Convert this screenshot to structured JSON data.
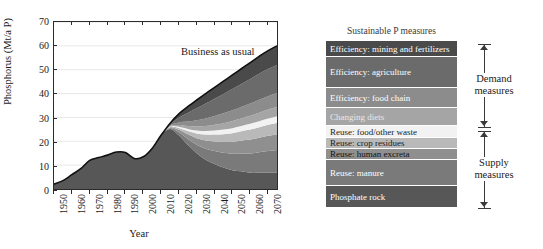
{
  "chart_data": {
    "type": "area",
    "title": "",
    "xlabel": "Year",
    "ylabel": "Phosphorus (Mt/a P)",
    "xlim": [
      1950,
      2075
    ],
    "ylim": [
      0,
      70
    ],
    "ytick_values": [
      0,
      10,
      20,
      30,
      40,
      50,
      60,
      70
    ],
    "xtick_values": [
      1950,
      1960,
      1970,
      1980,
      1990,
      2000,
      2010,
      2020,
      2030,
      2040,
      2050,
      2060,
      2070
    ],
    "grid": "horizontal",
    "legend_position": "right",
    "annotations": [
      {
        "text": "Business as usual",
        "x": 2022,
        "y": 52
      }
    ],
    "x": [
      1950,
      1955,
      1960,
      1965,
      1970,
      1975,
      1980,
      1985,
      1990,
      1995,
      2000,
      2005,
      2010,
      2015,
      2020,
      2025,
      2030,
      2035,
      2040,
      2045,
      2050,
      2055,
      2060,
      2065,
      2070,
      2075
    ],
    "business_as_usual_total": [
      2.0,
      3.5,
      6.0,
      8.5,
      12.0,
      13.2,
      14.2,
      15.5,
      15.3,
      12.8,
      13.5,
      17.0,
      22.5,
      27.5,
      31.5,
      34.5,
      37.3,
      40.0,
      42.6,
      45.2,
      47.8,
      50.4,
      53.0,
      55.6,
      58.0,
      60.0
    ],
    "series": [
      {
        "name": "Efficiency: mining and fertilizers",
        "color": "#4a4a4a",
        "values": [
          0,
          0,
          0,
          0,
          0,
          0,
          0,
          0,
          0,
          0,
          0,
          0,
          0,
          0.4,
          1.6,
          2.6,
          3.5,
          4.2,
          4.8,
          5.4,
          5.9,
          6.4,
          6.9,
          7.3,
          7.7,
          8.0
        ]
      },
      {
        "name": "Efficiency: agriculture",
        "color": "#6b6b6b",
        "values": [
          0,
          0,
          0,
          0,
          0,
          0,
          0,
          0,
          0,
          0,
          0,
          0,
          0,
          0.5,
          2.0,
          3.6,
          5.0,
          6.2,
          7.2,
          8.1,
          8.9,
          9.6,
          10.3,
          10.9,
          11.4,
          11.8
        ]
      },
      {
        "name": "Efficiency: food chain",
        "color": "#8c8c8c",
        "values": [
          0,
          0,
          0,
          0,
          0,
          0,
          0,
          0,
          0,
          0,
          0,
          0,
          0,
          0.3,
          1.1,
          1.9,
          2.6,
          3.2,
          3.7,
          4.1,
          4.5,
          4.8,
          5.1,
          5.4,
          5.6,
          5.8
        ]
      },
      {
        "name": "Changing diets",
        "color": "#a5a5a5",
        "values": [
          0,
          0,
          0,
          0,
          0,
          0,
          0,
          0,
          0,
          0,
          0,
          0,
          0,
          0.2,
          0.7,
          1.2,
          1.7,
          2.1,
          2.4,
          2.7,
          3.0,
          3.2,
          3.4,
          3.6,
          3.8,
          3.9
        ]
      },
      {
        "name": "Reuse: food/other waste",
        "color": "#f2f2f2",
        "values": [
          0,
          0,
          0,
          0,
          0,
          0,
          0,
          0,
          0,
          0,
          0,
          0,
          0,
          0.15,
          0.5,
          0.9,
          1.2,
          1.5,
          1.7,
          1.9,
          2.1,
          2.2,
          2.4,
          2.5,
          2.6,
          2.7
        ]
      },
      {
        "name": "Reuse: crop residues",
        "color": "#b9b9b9",
        "values": [
          0,
          0,
          0,
          0,
          0,
          0,
          0,
          0,
          0,
          0,
          0,
          0,
          0,
          0.2,
          0.8,
          1.4,
          2.0,
          2.5,
          2.9,
          3.3,
          3.6,
          3.9,
          4.2,
          4.4,
          4.6,
          4.8
        ]
      },
      {
        "name": "Reuse: human excreta",
        "color": "#8f8f8f",
        "values": [
          0,
          0,
          0,
          0,
          0,
          0,
          0,
          0,
          0,
          0,
          0,
          0,
          0,
          0.25,
          1.0,
          1.9,
          2.7,
          3.4,
          4.0,
          4.5,
          5.0,
          5.4,
          5.8,
          6.1,
          6.4,
          6.7
        ]
      },
      {
        "name": "Reuse: manure",
        "color": "#7a7a7a",
        "values": [
          0,
          0,
          0,
          0,
          0,
          0,
          0,
          0,
          0,
          0,
          0,
          0,
          0,
          0.3,
          1.3,
          2.5,
          3.6,
          4.6,
          5.4,
          6.2,
          6.9,
          7.5,
          8.1,
          8.6,
          9.1,
          9.5
        ]
      },
      {
        "name": "Phosphate rock",
        "color": "#575757",
        "values": [
          2.0,
          3.5,
          6.0,
          8.5,
          12.0,
          13.2,
          14.2,
          15.5,
          15.3,
          12.8,
          13.5,
          17.0,
          22.5,
          25.2,
          22.5,
          18.5,
          15.0,
          12.3,
          10.5,
          9.0,
          7.9,
          7.4,
          6.8,
          6.8,
          6.8,
          6.8
        ]
      }
    ]
  },
  "axes": {
    "y_title": "Phosphorus (Mt/a P)",
    "x_title": "Year",
    "y_ticks": [
      "70",
      "60",
      "50",
      "40",
      "30",
      "20",
      "10",
      "0"
    ],
    "x_ticks": [
      "1950",
      "1960",
      "1970",
      "1980",
      "1990",
      "2000",
      "2010",
      "2020",
      "2030",
      "2040",
      "2050",
      "2060",
      "2070"
    ]
  },
  "plot_annotation": {
    "business_as_usual": "Business as usual"
  },
  "legend": {
    "title": "Sustainable P measures",
    "bands": [
      {
        "label": "Efficiency: mining and fertilizers",
        "color": "#4a4a4a",
        "text_color": "#ffffff",
        "height": 16
      },
      {
        "label": "Efficiency: agriculture",
        "color": "#6b6b6b",
        "text_color": "#ffffff",
        "height": 31
      },
      {
        "label": "Efficiency: food chain",
        "color": "#8c8c8c",
        "text_color": "#ffffff",
        "height": 20
      },
      {
        "label": "Changing diets",
        "color": "#a5a5a5",
        "text_color": "#e8e8e8",
        "height": 18
      },
      {
        "label": "Reuse: food/other waste",
        "color": "#f2f2f2",
        "text_color": "#1a1a1a",
        "height": 12
      },
      {
        "label": "Reuse: crop residues",
        "color": "#b9b9b9",
        "text_color": "#1a1a1a",
        "height": 11
      },
      {
        "label": "Reuse: human excreta",
        "color": "#8f8f8f",
        "text_color": "#111111",
        "height": 11
      },
      {
        "label": "Reuse: manure",
        "color": "#7a7a7a",
        "text_color": "#ffffff",
        "height": 26
      },
      {
        "label": "Phosphate rock",
        "color": "#575757",
        "text_color": "#ffffff",
        "height": 22
      }
    ]
  },
  "brackets": [
    {
      "label_line1": "Demand",
      "label_line2": "measures",
      "top": 44,
      "bottom": 127
    },
    {
      "label_line1": "Supply",
      "label_line2": "measures",
      "top": 131,
      "bottom": 208
    }
  ]
}
